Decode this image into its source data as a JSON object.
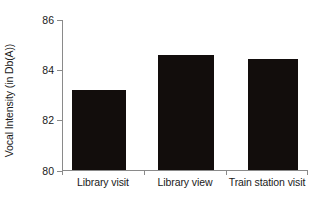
{
  "chart_data": {
    "type": "bar",
    "title": "",
    "xlabel": "",
    "ylabel": "Vocal Intensity (in Db(A))",
    "categories": [
      "Library visit",
      "Library view",
      "Train station visit"
    ],
    "values": [
      83.2,
      84.6,
      84.45
    ],
    "ylim": [
      80,
      86
    ],
    "yticks": [
      80,
      82,
      84,
      86
    ],
    "ytick_labels": [
      "80",
      "82",
      "84",
      "86"
    ],
    "grid": false,
    "legend": null,
    "bar_color": "#120d0c",
    "axis_color": "#8a8a8a",
    "background": "#ffffff"
  }
}
